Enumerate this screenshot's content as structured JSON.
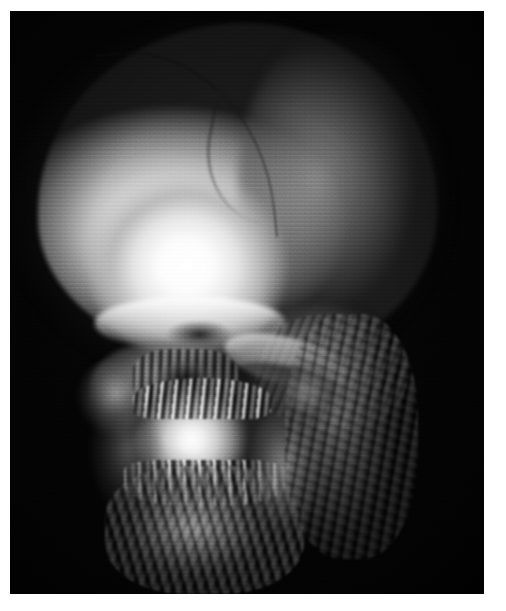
{
  "document": {
    "kind": "medical-image-figure",
    "background_color": "#ffffff",
    "caption": ""
  },
  "image": {
    "title": "",
    "modality": "CT",
    "technique": "3D volume rendering",
    "subject": "human skull",
    "view": "oblique anterolateral (three-quarter) view",
    "colormap": "grayscale",
    "background_color": "#050505",
    "highlight_color": "#ffffff",
    "midtone_color": "#8f8f8f",
    "shadow_color": "#141414",
    "frame": {
      "left": 10,
      "top": 11,
      "width": 474,
      "height": 583
    },
    "visible_artifacts": [
      "horizontal slice banding",
      "surface stair-stepping",
      "speckle noise"
    ],
    "anatomy": [
      {
        "name": "cranial-vault",
        "label": "Cranial vault (calvaria)",
        "brightness": "very bright"
      },
      {
        "name": "coronal-suture",
        "label": "Suture line",
        "brightness": "dark line"
      },
      {
        "name": "frontal-bone",
        "label": "Frontal bone",
        "brightness": "saturated white"
      },
      {
        "name": "supraorbital-ridge",
        "label": "Supraorbital ridge",
        "brightness": "bright"
      },
      {
        "name": "orbit",
        "label": "Orbital region",
        "brightness": "dark"
      },
      {
        "name": "temporal-region",
        "label": "Temporal region",
        "brightness": "mid gray"
      },
      {
        "name": "zygomatic-arch",
        "label": "Zygomatic arch",
        "brightness": "bright edge"
      },
      {
        "name": "nasal-cavity",
        "label": "Nasal cavity / turbinates",
        "brightness": "dark mottled"
      },
      {
        "name": "maxilla",
        "label": "Maxilla",
        "brightness": "bright"
      },
      {
        "name": "upper-teeth",
        "label": "Upper dental arch",
        "brightness": "mixed high contrast"
      },
      {
        "name": "lower-teeth",
        "label": "Lower dental arch",
        "brightness": "mixed high contrast"
      },
      {
        "name": "mandible",
        "label": "Mandible",
        "brightness": "mid-bright"
      },
      {
        "name": "cervical-spine",
        "label": "Cervical spine / soft tissue",
        "brightness": "dim gray"
      }
    ]
  }
}
